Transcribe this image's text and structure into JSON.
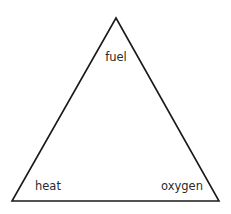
{
  "diagram": {
    "shape": "triangle",
    "stroke_color": "#1a1a1a",
    "vertices": {
      "top": "fuel",
      "bottom_left": "heat",
      "bottom_right": "oxygen"
    },
    "labels": [
      {
        "text": "fuel",
        "position": "top"
      },
      {
        "text": "heat",
        "position": "bottom-left"
      },
      {
        "text": "oxygen",
        "position": "bottom-right"
      }
    ]
  }
}
